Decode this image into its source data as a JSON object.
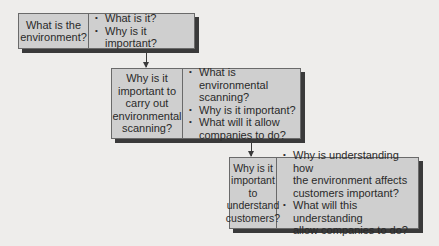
{
  "diagram": {
    "type": "flow",
    "nodes": [
      {
        "question": "What is the environment?",
        "question_lines": [
          "What is the",
          "environment?"
        ],
        "points": [
          {
            "lines": [
              "What is it?"
            ]
          },
          {
            "lines": [
              "Why is it important?"
            ]
          }
        ]
      },
      {
        "question": "Why is it important to carry out environmental scanning?",
        "question_lines": [
          "Why is it",
          "important to",
          "carry out",
          "environmental",
          "scanning?"
        ],
        "points": [
          {
            "lines": [
              "What is environmental",
              "scanning?"
            ]
          },
          {
            "lines": [
              "Why is it important?"
            ]
          },
          {
            "lines": [
              "What will it allow",
              "companies to do?"
            ]
          }
        ]
      },
      {
        "question": "Why is it important to understand customers?",
        "question_lines": [
          "Why is it",
          "important to",
          "understand",
          "customers?"
        ],
        "points": [
          {
            "lines": [
              "Why is understanding how",
              "the environment affects",
              "customers important?"
            ]
          },
          {
            "lines": [
              "What will this understanding",
              "allow companies to do?"
            ]
          }
        ]
      }
    ],
    "edges": [
      {
        "from": 0,
        "to": 1
      },
      {
        "from": 1,
        "to": 2
      }
    ],
    "bullet_glyph": "•",
    "colors": {
      "box_fill": "#cfcfcf",
      "shadow": "#3a3a3a",
      "background": "#eeedeb"
    }
  }
}
